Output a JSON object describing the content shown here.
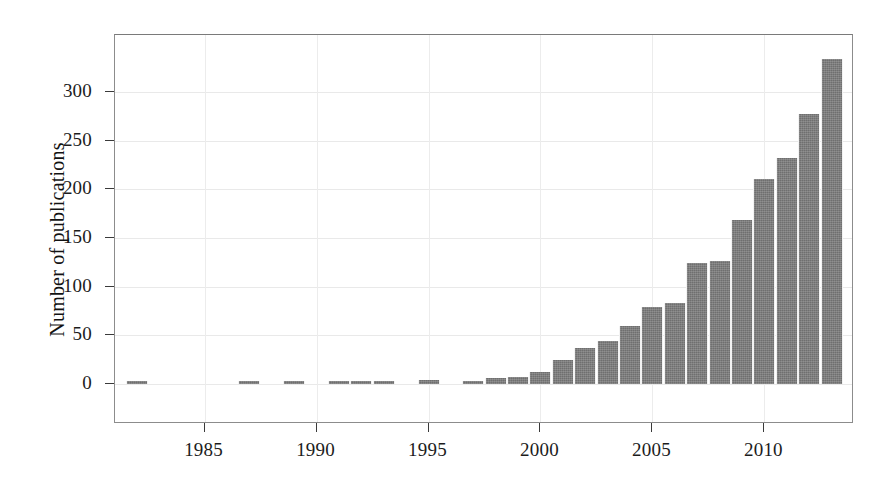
{
  "chart_data": {
    "type": "bar",
    "title": "",
    "subtitle": "",
    "xlabel": "",
    "ylabel": "Number of publications",
    "legend": [],
    "legend_position": "none",
    "grid": true,
    "bar_color": "#6f6f6f",
    "xlim": [
      1981,
      2014
    ],
    "ylim": [
      0,
      345
    ],
    "ytick_values": [
      0,
      50,
      100,
      150,
      200,
      250,
      300
    ],
    "ytick_labels": [
      "0",
      "50",
      "100",
      "150",
      "200",
      "250",
      "300"
    ],
    "xtick_values": [
      1985,
      1990,
      1995,
      2000,
      2005,
      2010
    ],
    "xtick_labels": [
      "1985",
      "1990",
      "1995",
      "2000",
      "2005",
      "2010"
    ],
    "categories": [
      1982,
      1987,
      1989,
      1991,
      1992,
      1993,
      1995,
      1997,
      1998,
      1999,
      2000,
      2001,
      2002,
      2003,
      2004,
      2005,
      2006,
      2007,
      2008,
      2009,
      2010,
      2011,
      2012,
      2013
    ],
    "values": [
      2,
      2,
      2,
      3,
      3,
      2,
      4,
      3,
      6,
      7,
      12,
      25,
      37,
      44,
      60,
      79,
      83,
      124,
      126,
      168,
      211,
      232,
      277,
      334
    ]
  }
}
